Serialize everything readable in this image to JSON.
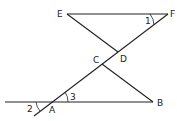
{
  "diagram": {
    "points": {
      "E": {
        "label": "E",
        "x": 67,
        "y": 14
      },
      "F": {
        "label": "F",
        "x": 168,
        "y": 14
      },
      "D": {
        "label": "D",
        "x": 118,
        "y": 52
      },
      "C": {
        "label": "C",
        "x": 102,
        "y": 64
      },
      "B": {
        "label": "B",
        "x": 153,
        "y": 102
      },
      "A": {
        "label": "A",
        "x": 52,
        "y": 102
      }
    },
    "angles": {
      "angle1": {
        "label": "1"
      },
      "angle2": {
        "label": "2"
      },
      "angle3": {
        "label": "3"
      }
    },
    "segments": [
      "EF",
      "ED",
      "CB",
      "AB (extended left)",
      "FA (extended beyond A)"
    ]
  }
}
